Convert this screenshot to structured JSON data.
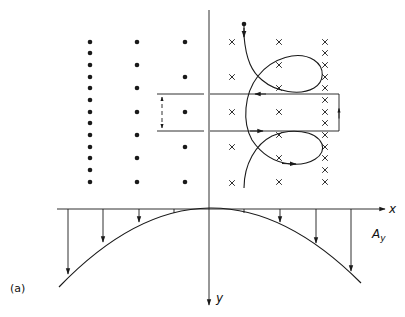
{
  "figure": {
    "panel_label": "(a)",
    "x_axis_label": "x",
    "y_axis_label": "y",
    "field_label_main": "A",
    "field_label_sub": "y",
    "ink_color": "#1a1a1a"
  },
  "axes": {
    "origin": [
      209,
      209
    ],
    "x_axis": {
      "from": 57,
      "to": 385
    },
    "y_axis": {
      "from": 10,
      "to": 305
    }
  },
  "dots_out_of_page": {
    "columns": [
      {
        "x": 90,
        "ys": [
          42,
          53,
          65,
          77,
          88,
          100,
          112,
          123,
          135,
          147,
          158,
          170,
          182
        ]
      },
      {
        "x": 137,
        "ys": [
          42,
          65,
          88,
          112,
          135,
          158,
          182
        ]
      },
      {
        "x": 185,
        "ys": [
          42,
          77,
          112,
          147,
          182
        ]
      }
    ]
  },
  "crosses_into_page": {
    "columns": [
      {
        "x": 232,
        "ys": [
          42,
          77,
          112,
          147,
          183
        ]
      },
      {
        "x": 279,
        "ys": [
          42,
          65,
          88,
          112,
          135,
          158,
          182
        ]
      },
      {
        "x": 325,
        "ys": [
          42,
          53,
          65,
          77,
          88,
          100,
          112,
          123,
          135,
          147,
          158,
          170,
          182
        ]
      }
    ]
  },
  "loop_rectangle": {
    "left": 157,
    "right": 339,
    "top": 94,
    "bottom": 131,
    "axis_gap": [
      204,
      210
    ],
    "span_marker_x": 162
  },
  "trajectory": {
    "start": [
      244,
      24
    ],
    "path": "M244,24 L244,36 C246,60 252,72 262,80 C276,92 300,96 314,88 C324,82 326,68 314,60 C298,50 272,58 258,76 C244,94 242,122 252,140 C260,152 272,162 290,164 C310,166 326,156 322,144 C316,130 290,128 272,136 C256,144 244,164 244,188"
  },
  "field_arrows": [
    {
      "x": 68,
      "y_tip": 274
    },
    {
      "x": 103,
      "y_tip": 242
    },
    {
      "x": 139,
      "y_tip": 222
    },
    {
      "x": 174,
      "y_tip": 213
    },
    {
      "x": 244,
      "y_tip": 213
    },
    {
      "x": 280,
      "y_tip": 222
    },
    {
      "x": 316,
      "y_tip": 243
    },
    {
      "x": 351,
      "y_tip": 271
    }
  ],
  "parabola": {
    "path": "M59,287 Q209,131 361,283"
  }
}
